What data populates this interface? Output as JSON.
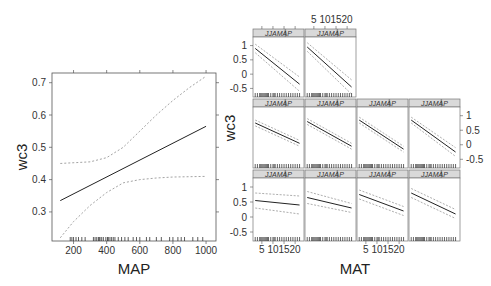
{
  "chart_data": [
    {
      "type": "line",
      "title": "",
      "xlabel": "MAP",
      "ylabel": "wc3",
      "xlim": [
        70,
        1060
      ],
      "ylim": [
        0.21,
        0.73
      ],
      "x_ticks": [
        200,
        400,
        600,
        800,
        1000
      ],
      "y_ticks": [
        0.3,
        0.4,
        0.5,
        0.6,
        0.7
      ],
      "series": [
        {
          "name": "fit",
          "style": "solid",
          "x": [
            120,
            1000
          ],
          "values": [
            0.335,
            0.565
          ]
        },
        {
          "name": "upper CI",
          "style": "dashed",
          "x": [
            120,
            300,
            400,
            500,
            600,
            700,
            800,
            900,
            1000
          ],
          "values": [
            0.45,
            0.455,
            0.468,
            0.5,
            0.55,
            0.6,
            0.645,
            0.685,
            0.72
          ]
        },
        {
          "name": "lower CI",
          "style": "dashed",
          "x": [
            120,
            200,
            300,
            400,
            500,
            600,
            700,
            800,
            1000
          ],
          "values": [
            0.22,
            0.27,
            0.32,
            0.36,
            0.39,
            0.4,
            0.405,
            0.408,
            0.41
          ]
        }
      ],
      "rug": true
    },
    {
      "type": "line",
      "layout": "trellis 3 rows (2,4,4 panels)",
      "xlabel": "MAT",
      "ylabel": "wc3",
      "strip_label": "JJAMAP",
      "x_ticks": [
        5,
        10,
        15,
        20
      ],
      "y_ticks": [
        -0.5,
        0,
        0.5,
        1
      ],
      "ylim": [
        -0.8,
        1.3
      ],
      "panels": [
        {
          "row": 1,
          "col": 1,
          "fit": [
            0.9,
            -0.35
          ],
          "upper": [
            1.05,
            -0.1
          ],
          "lower": [
            0.75,
            -0.6
          ]
        },
        {
          "row": 1,
          "col": 2,
          "fit": [
            0.95,
            -0.45
          ],
          "upper": [
            1.1,
            -0.2
          ],
          "lower": [
            0.8,
            -0.7
          ]
        },
        {
          "row": 2,
          "col": 1,
          "fit": [
            0.75,
            0.05
          ],
          "upper": [
            0.85,
            0.15
          ],
          "lower": [
            0.65,
            -0.05
          ]
        },
        {
          "row": 2,
          "col": 2,
          "fit": [
            0.8,
            -0.05
          ],
          "upper": [
            0.9,
            0.05
          ],
          "lower": [
            0.7,
            -0.15
          ]
        },
        {
          "row": 2,
          "col": 3,
          "fit": [
            0.85,
            -0.15
          ],
          "upper": [
            0.95,
            -0.05
          ],
          "lower": [
            0.75,
            -0.25
          ]
        },
        {
          "row": 2,
          "col": 4,
          "fit": [
            0.85,
            -0.25
          ],
          "upper": [
            0.95,
            -0.1
          ],
          "lower": [
            0.75,
            -0.4
          ]
        },
        {
          "row": 3,
          "col": 1,
          "fit": [
            0.55,
            0.4
          ],
          "upper": [
            0.8,
            0.7
          ],
          "lower": [
            0.3,
            0.1
          ]
        },
        {
          "row": 3,
          "col": 2,
          "fit": [
            0.65,
            0.3
          ],
          "upper": [
            0.85,
            0.45
          ],
          "lower": [
            0.45,
            0.15
          ]
        },
        {
          "row": 3,
          "col": 3,
          "fit": [
            0.75,
            0.2
          ],
          "upper": [
            0.9,
            0.35
          ],
          "lower": [
            0.6,
            0.05
          ]
        },
        {
          "row": 3,
          "col": 4,
          "fit": [
            0.8,
            0.1
          ],
          "upper": [
            0.95,
            0.25
          ],
          "lower": [
            0.65,
            -0.05
          ]
        }
      ]
    }
  ],
  "labels": {
    "left_x": "MAP",
    "left_y": "wc3",
    "right_x": "MAT",
    "right_y": "wc3",
    "strip": "JJAMAP",
    "left_xticks": [
      "200",
      "400",
      "600",
      "800",
      "1000"
    ],
    "left_yticks": [
      "0.3",
      "0.4",
      "0.5",
      "0.6",
      "0.7"
    ],
    "right_xticks": [
      "5",
      "10",
      "15",
      "20"
    ],
    "right_yticks": [
      "1",
      "0.5",
      "0",
      "-0.5"
    ]
  }
}
